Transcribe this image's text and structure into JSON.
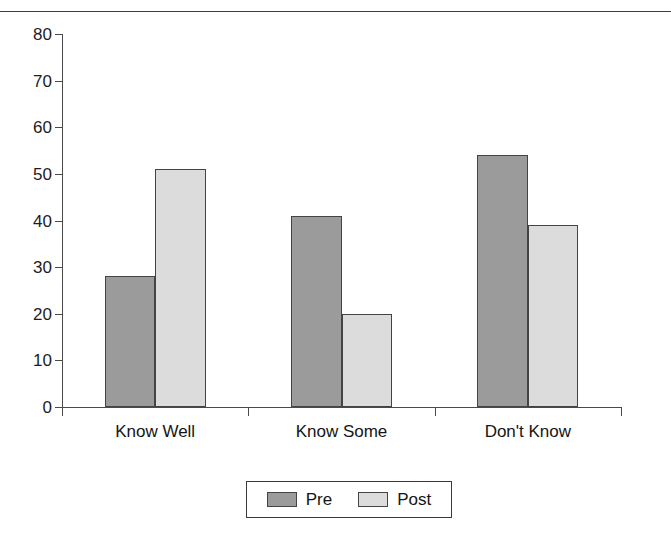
{
  "chart_data": {
    "type": "bar",
    "title": "",
    "xlabel": "",
    "ylabel": "",
    "categories": [
      "Know Well",
      "Know Some",
      "Don't Know"
    ],
    "series": [
      {
        "name": "Pre",
        "color": "#9b9b9b",
        "values": [
          28,
          41,
          54
        ]
      },
      {
        "name": "Post",
        "color": "#dcdcdc",
        "values": [
          51,
          20,
          39
        ]
      }
    ],
    "ylim": [
      0,
      80
    ],
    "ytick_step": 10,
    "ytick_labels": [
      "0",
      "10",
      "20",
      "30",
      "40",
      "50",
      "60",
      "70",
      "80"
    ],
    "grid": false,
    "legend_position": "bottom-center"
  },
  "legend": {
    "entries": [
      {
        "label": "Pre",
        "swatch": "pre-swatch"
      },
      {
        "label": "Post",
        "swatch": "post-swatch"
      }
    ]
  },
  "colors": {
    "pre": "#9b9b9b",
    "post": "#dcdcdc",
    "axis": "#4a4a4a",
    "bar_border": "#444444",
    "text": "#151515",
    "background": "#ffffff"
  },
  "clipped_caption": ""
}
